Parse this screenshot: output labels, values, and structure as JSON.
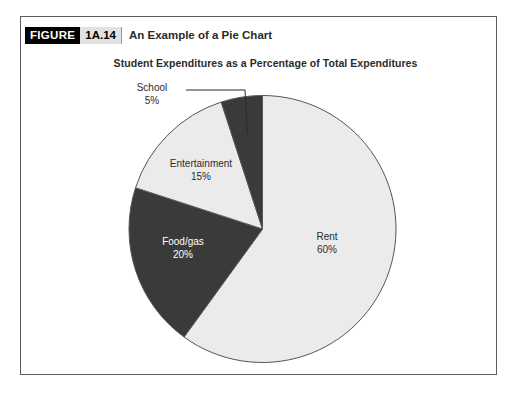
{
  "figure": {
    "label_word": "FIGURE",
    "number": "1A.14",
    "title": "An Example of a Pie Chart"
  },
  "colors": {
    "frame_border": "#5d5d60",
    "slice_light": "#ebebeb",
    "slice_dark": "#3a3a3a",
    "slice_outline": "#55555a",
    "text_dark": "#2b2b2b",
    "text_on_dark": "#ffffff",
    "tag_background": "#000000",
    "tag_number_background": "#e2e2e2"
  },
  "chart_data": {
    "type": "pie",
    "title": "Student Expenditures as a Percentage of Total Expenditures",
    "xlabel": "",
    "ylabel": "",
    "unit": "%",
    "total": 100,
    "legend_position": "none",
    "grid": false,
    "start_angle_deg": 0,
    "direction": "clockwise",
    "categories": [
      "Rent",
      "Food/gas",
      "Entertainment",
      "School"
    ],
    "values": [
      60,
      20,
      15,
      5
    ],
    "slices": [
      {
        "name": "Rent",
        "label": "Rent",
        "value": 60,
        "value_text": "60%",
        "fill": "#ebebeb",
        "label_color": "dark",
        "start_deg": 0,
        "end_deg": 216,
        "leader_line": false
      },
      {
        "name": "Food/gas",
        "label": "Food/gas",
        "value": 20,
        "value_text": "20%",
        "fill": "#3a3a3a",
        "label_color": "light",
        "start_deg": 216,
        "end_deg": 288,
        "leader_line": false
      },
      {
        "name": "Entertainment",
        "label": "Entertainment",
        "value": 15,
        "value_text": "15%",
        "fill": "#ebebeb",
        "label_color": "dark",
        "start_deg": 288,
        "end_deg": 342,
        "leader_line": false
      },
      {
        "name": "School",
        "label": "School",
        "value": 5,
        "value_text": "5%",
        "fill": "#3a3a3a",
        "label_color": "dark",
        "start_deg": 342,
        "end_deg": 360,
        "leader_line": true
      }
    ]
  }
}
